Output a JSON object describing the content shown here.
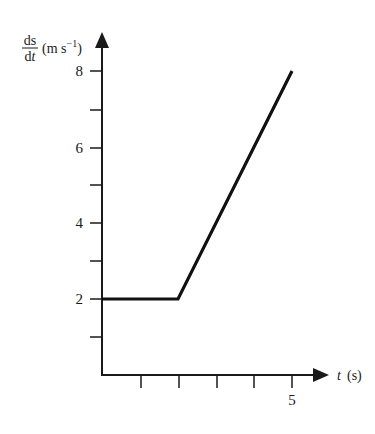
{
  "chart_data": {
    "type": "line",
    "title": "",
    "xlabel": "t (s)",
    "xlabel_var": "t",
    "xlabel_unit": "(s)",
    "ylabel": "ds/dt (m s⁻¹)",
    "ylabel_numerator": "ds",
    "ylabel_denominator": "dt",
    "ylabel_unit": "(m s⁻¹)",
    "xlim": [
      0,
      5.9
    ],
    "ylim": [
      0,
      8.8
    ],
    "x_ticks": [
      1,
      2,
      3,
      4,
      5
    ],
    "x_tick_labels": {
      "5": "5"
    },
    "y_ticks": [
      1,
      2,
      3,
      4,
      5,
      6,
      7,
      8
    ],
    "y_tick_labels": {
      "2": "2",
      "4": "4",
      "6": "6",
      "8": "8"
    },
    "grid": false,
    "legend": null,
    "series": [
      {
        "name": "velocity",
        "x": [
          0,
          2,
          5
        ],
        "y": [
          2,
          2,
          8
        ]
      }
    ]
  },
  "labels": {
    "y_numerator": "ds",
    "y_denominator": "dt",
    "y_unit_open": "(m s",
    "y_unit_exp": "−1",
    "y_unit_close": ")",
    "x_var": "t",
    "x_unit": "(s)",
    "ytick_2": "2",
    "ytick_4": "4",
    "ytick_6": "6",
    "ytick_8": "8",
    "xtick_5": "5"
  }
}
